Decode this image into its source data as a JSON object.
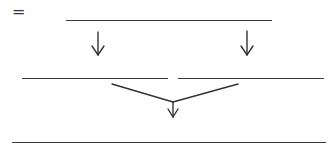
{
  "diagram": {
    "type": "fill-in-derivation-tree",
    "marker": "=",
    "line_color": "#3a3a3a",
    "blanks": [
      {
        "id": "top",
        "label": ""
      },
      {
        "id": "middle-left",
        "label": ""
      },
      {
        "id": "middle-right",
        "label": ""
      },
      {
        "id": "bottom",
        "label": ""
      }
    ],
    "arrows": [
      {
        "from": "top",
        "to": "middle-left",
        "direction": "down"
      },
      {
        "from": "top",
        "to": "middle-right",
        "direction": "down"
      },
      {
        "from": [
          "middle-left",
          "middle-right"
        ],
        "to": "bottom",
        "direction": "merge-down"
      }
    ]
  }
}
